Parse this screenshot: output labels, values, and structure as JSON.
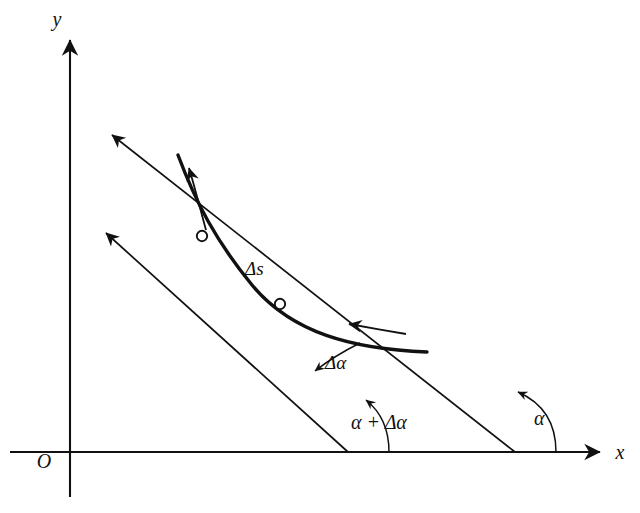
{
  "figure": {
    "background_color": "#ffffff",
    "stroke_color": "#111111",
    "width": 640,
    "height": 513
  },
  "axes": {
    "x_label": "x",
    "y_label": "y",
    "origin_label": "O",
    "x_axis": {
      "x1": 10,
      "y1": 452,
      "x2": 604,
      "y2": 452
    },
    "y_axis": {
      "x1": 70,
      "y1": 497,
      "x2": 70,
      "y2": 36
    }
  },
  "curve": {
    "name": "plane-curve",
    "direction_label": "",
    "path": "M 178 155 C 196 203, 215 240, 252 285 C 290 330, 352 348, 427 352",
    "stroke_width": 3.4
  },
  "points": [
    {
      "name": "point-upper",
      "label": "",
      "x": 202,
      "y": 236,
      "radius": 5.2
    },
    {
      "name": "point-lower",
      "label": "",
      "x": 280,
      "y": 304,
      "radius": 5.2
    }
  ],
  "tangents": [
    {
      "name": "tangent-at-upper-point",
      "angle_label": "α + Δα",
      "from": {
        "x": 348,
        "y": 452
      },
      "to": {
        "x": 100,
        "y": 228
      },
      "arrow": "up-left"
    },
    {
      "name": "tangent-at-lower-point",
      "angle_label": "α",
      "from": {
        "x": 515,
        "y": 452
      },
      "to": {
        "x": 106,
        "y": 131
      },
      "arrow": "up-left"
    }
  ],
  "labels": {
    "arc_length": "Δs",
    "delta_angle": "Δα",
    "angle_alpha": "α",
    "angle_alpha_plus_delta": "α + Δα",
    "axis_x": "x",
    "axis_y": "y",
    "origin": "O"
  },
  "label_positions": {
    "arc_length": {
      "x": 243,
      "y": 274
    },
    "delta_angle": {
      "x": 326,
      "y": 368
    },
    "angle_alpha": {
      "x": 538,
      "y": 424
    },
    "angle_alpha_plus_delta": {
      "x": 355,
      "y": 427
    },
    "axis_x": {
      "x": 618,
      "y": 459
    },
    "axis_y": {
      "x": 63,
      "y": 25
    },
    "origin": {
      "x": 44,
      "y": 464
    }
  },
  "direction_arrows": [
    {
      "name": "curve-direction-arrow-upper",
      "description": "arrow along upper branch pointing up",
      "from": {
        "x": 199,
        "y": 214
      },
      "to": {
        "x": 186,
        "y": 163
      }
    },
    {
      "name": "curve-direction-arrow-lower",
      "description": "arrow along lower branch pointing left",
      "from": {
        "x": 400,
        "y": 333
      },
      "to": {
        "x": 345,
        "y": 323
      }
    }
  ],
  "angle_arcs": [
    {
      "name": "angle-arc-alpha-plus-delta-alpha",
      "description": "arc from x-axis to steeper tangent at x=348"
    },
    {
      "name": "angle-arc-alpha",
      "description": "arc from x-axis to shallower tangent at x=515"
    },
    {
      "name": "angle-arc-delta-alpha",
      "description": "small arc between the two tangent lines"
    }
  ]
}
